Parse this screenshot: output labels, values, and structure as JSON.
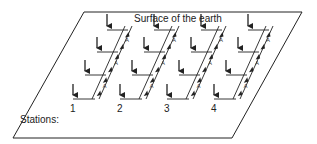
{
  "figure": {
    "title": "Surface of the earth",
    "stations_label": "Stations:",
    "tube_label": "A",
    "colors": {
      "line": "#222222",
      "background": "#ffffff"
    }
  },
  "plane": {
    "corners": [
      [
        84,
        12
      ],
      [
        302,
        12
      ],
      [
        232,
        138
      ],
      [
        13,
        138
      ]
    ]
  },
  "stations": [
    {
      "label": "1",
      "dx": 0
    },
    {
      "label": "2",
      "dx": 47
    },
    {
      "label": "3",
      "dx": 94
    },
    {
      "label": "4",
      "dx": 141
    }
  ],
  "levels": [
    {
      "arrow_x": 107,
      "arrow_top": 14,
      "branch_y": 30,
      "branch_x2": 125
    },
    {
      "arrow_x": 97,
      "arrow_top": 37,
      "branch_y": 52,
      "branch_x2": 115
    },
    {
      "arrow_x": 85,
      "arrow_top": 60,
      "branch_y": 75,
      "branch_x2": 103
    },
    {
      "arrow_x": 73,
      "arrow_top": 84,
      "branch_y": 99,
      "branch_x2": 92
    }
  ]
}
